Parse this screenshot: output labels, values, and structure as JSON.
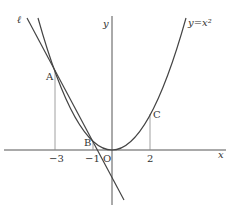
{
  "diagram": {
    "curve_label": "y=x²",
    "line_label": "ℓ",
    "axis_x_label": "x",
    "axis_y_label": "y",
    "origin_label": "O",
    "points": [
      {
        "name": "A",
        "x": -3,
        "y": 9
      },
      {
        "name": "B",
        "x": -1,
        "y": 1
      },
      {
        "name": "C",
        "x": 2,
        "y": 4
      }
    ],
    "tick_labels": [
      "−3",
      "−1",
      "2"
    ],
    "colors": {
      "stroke": "#444444",
      "guide": "#888888"
    }
  }
}
